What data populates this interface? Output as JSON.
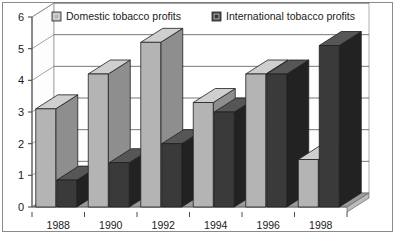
{
  "chart_data": {
    "type": "bar",
    "title": "",
    "subtitle": "",
    "xlabel": "",
    "ylabel": "",
    "categories": [
      "1988",
      "1990",
      "1992",
      "1994",
      "1996",
      "1998"
    ],
    "series": [
      {
        "name": "Domestic tobacco profits",
        "color": "#b4b4b4",
        "values": [
          3.1,
          4.2,
          5.2,
          3.3,
          4.2,
          1.5
        ]
      },
      {
        "name": "International tobacco profits",
        "color": "#3a3a3a",
        "values": [
          0.85,
          1.4,
          2.0,
          3.0,
          4.2,
          5.1
        ]
      }
    ],
    "ylim": [
      0,
      6
    ],
    "yticks": [
      0,
      1,
      2,
      3,
      4,
      5,
      6
    ],
    "ytick_labels": [
      "0",
      "1",
      "2",
      "3",
      "4",
      "5",
      "6"
    ],
    "xtick_labels": [
      "1988",
      "1990",
      "1992",
      "1994",
      "1996",
      "1998"
    ],
    "grid": true,
    "grid_axis": "y",
    "legend_position": "top-inside",
    "style": "3d-column",
    "annotations": []
  },
  "legend": {
    "items": [
      {
        "label": "Domestic tobacco profits",
        "swatch": "#b4b4b4"
      },
      {
        "label": "International tobacco profits",
        "swatch": "#3a3a3a"
      }
    ]
  },
  "colors": {
    "domestic_front": "#b4b4b4",
    "domestic_top": "#cfcfcf",
    "domestic_side": "#8e8e8e",
    "international_front": "#3a3a3a",
    "international_top": "#565656",
    "international_side": "#222222",
    "floor": "#9a9a9a",
    "floor_edge": "#bdbdbd",
    "wall": "#ffffff",
    "grid": "#555555",
    "axis": "#4a4a4a",
    "border": "#8a8a8a",
    "text": "#1a1a1a"
  }
}
